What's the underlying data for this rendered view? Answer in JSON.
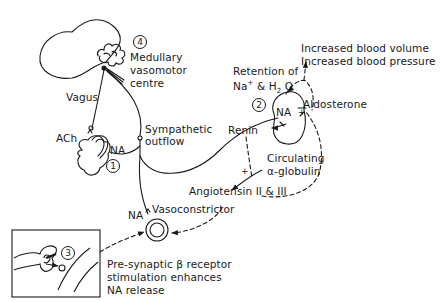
{
  "diagram": {
    "colors": {
      "ink": "#1a1a1a",
      "background": "#ffffff"
    },
    "markers": [
      {
        "id": "1",
        "label": "1",
        "site": "heart"
      },
      {
        "id": "2",
        "label": "2",
        "site": "kidney"
      },
      {
        "id": "3",
        "label": "3",
        "site": "presynaptic-terminal"
      },
      {
        "id": "4",
        "label": "4",
        "site": "medulla"
      }
    ],
    "labels": {
      "medulla_line1": "Medullary",
      "medulla_line2": "vasomotor",
      "medulla_line3": "centre",
      "vagus": "Vagus",
      "ach": "ACh",
      "na_heart": "NA",
      "sympathetic_line1": "Sympathetic",
      "sympathetic_line2": "outflow",
      "retention_line1": "Retention of",
      "retention_na": "Na",
      "retention_plus": "+",
      "retention_and": " & H",
      "retention_sub": "2",
      "retention_o": " O",
      "increased_volume": "Increased blood volume",
      "increased_pressure": "Increased blood pressure",
      "na_kidney": "NA",
      "aldosterone": "Aldosterone",
      "renin": "Renin",
      "circulating_line1": "Circulating",
      "circulating_line2": "α-globulin",
      "angiotensin": "Angiotensin II & III",
      "vasoconstrictor": "Vasoconstrictor",
      "na_vessel": "NA",
      "presynaptic_line1": "Pre-synaptic β receptor",
      "presynaptic_line2": "stimulation enhances",
      "presynaptic_line3": "NA release",
      "plus_renin": "+",
      "plus_aldo": "+"
    }
  }
}
